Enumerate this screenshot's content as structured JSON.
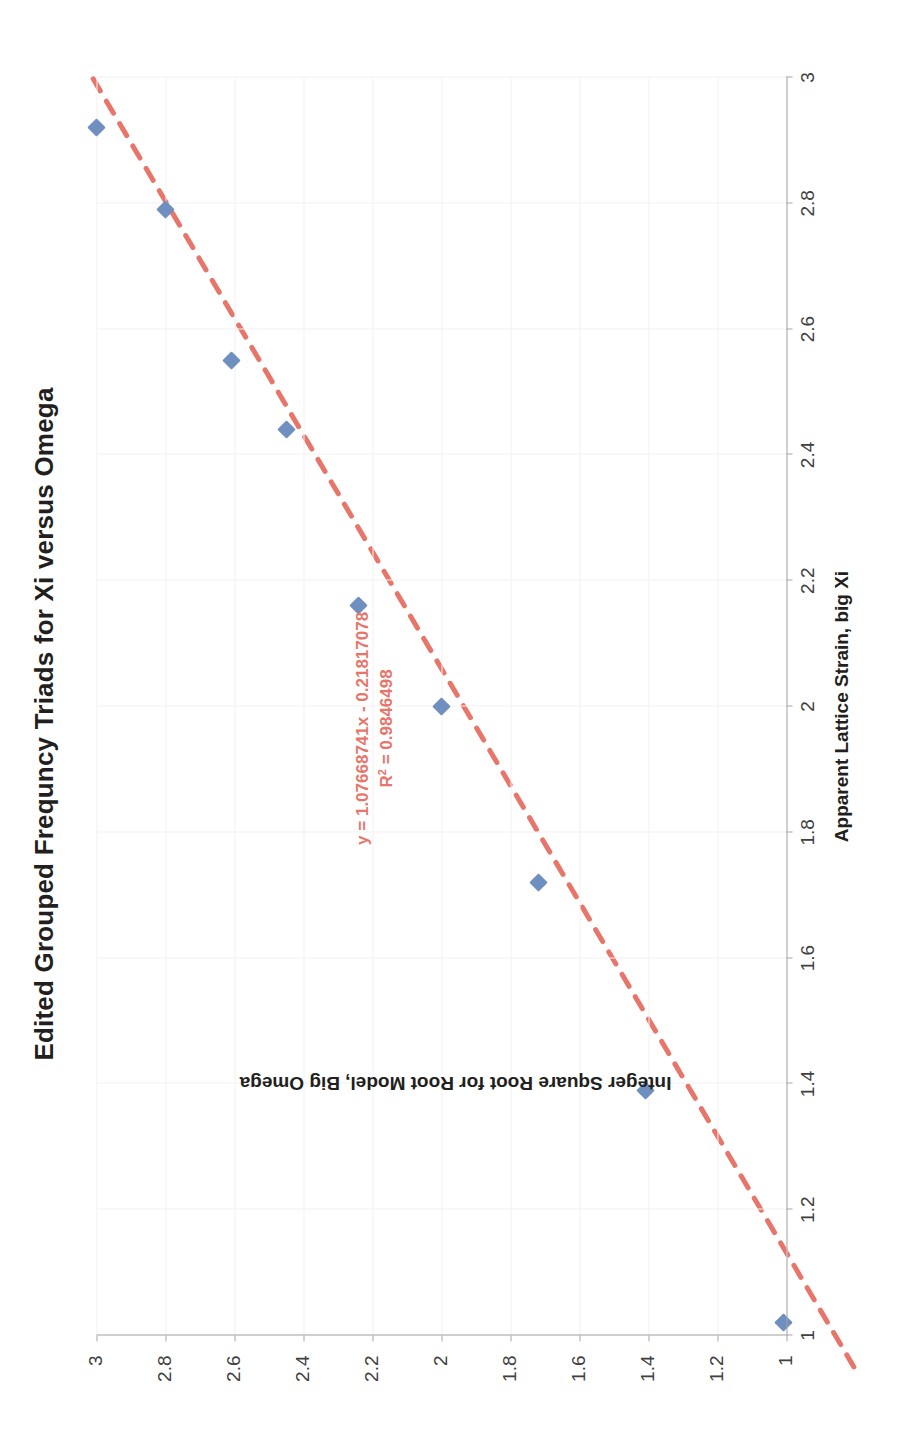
{
  "chart_data": {
    "type": "scatter",
    "title": "Edited Grouped Frequncy Triads for Xi versus Omega",
    "xlabel": "Apparent Lattice Strain, big Xi",
    "ylabel": "Integer Square Root for Root Model, Big Omega",
    "xlim": [
      1,
      3
    ],
    "ylim": [
      1,
      3
    ],
    "xticks": [
      "1",
      "1.2",
      "1.4",
      "1.6",
      "1.8",
      "2",
      "2.2",
      "2.4",
      "2.6",
      "2.8",
      "3"
    ],
    "yticks": [
      "1",
      "1.2",
      "1.4",
      "1.6",
      "1.8",
      "2",
      "2.2",
      "2.4",
      "2.6",
      "2.8",
      "3"
    ],
    "grid": true,
    "legend": "none",
    "x": [
      1.02,
      1.39,
      1.72,
      2.0,
      2.16,
      2.44,
      2.55,
      2.79,
      2.92
    ],
    "y": [
      1.01,
      1.41,
      1.72,
      2.0,
      2.24,
      2.45,
      2.61,
      2.8,
      3.0
    ],
    "series": [
      {
        "name": "Integer Square Root for Root Model, Big Omega",
        "marker": "diamond",
        "color": "#6f8fc0",
        "values": [
          {
            "x": 1.02,
            "y": 1.01
          },
          {
            "x": 1.39,
            "y": 1.41
          },
          {
            "x": 1.72,
            "y": 1.72
          },
          {
            "x": 2.0,
            "y": 2.0
          },
          {
            "x": 2.16,
            "y": 2.24
          },
          {
            "x": 2.44,
            "y": 2.45
          },
          {
            "x": 2.55,
            "y": 2.61
          },
          {
            "x": 2.79,
            "y": 2.8
          },
          {
            "x": 2.92,
            "y": 3.0
          }
        ]
      }
    ],
    "trendline": {
      "type": "linear",
      "style": "dashed",
      "color": "#e8756a",
      "slope": 1.07668741,
      "intercept": -0.21817078,
      "r_squared": 0.9846498,
      "equation_label": "y = 1.07668741x - 0.21817078",
      "r2_label_prefix": "R",
      "r2_label_sup": "2",
      "r2_label_value": " = 0.9846498"
    }
  },
  "colors": {
    "marker": "#6f8fc0",
    "trendline": "#e8756a",
    "axis": "#a6a6a6",
    "grid": "#f2f2f2",
    "text": "#231f20",
    "tick_text": "#404040"
  }
}
